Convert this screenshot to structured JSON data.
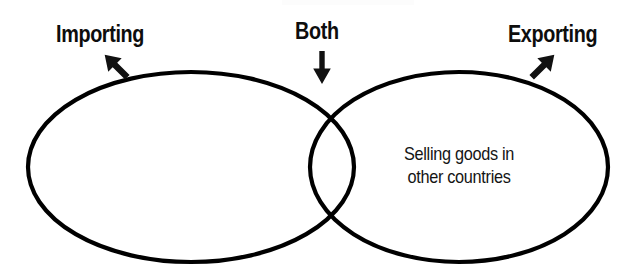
{
  "diagram": {
    "type": "venn",
    "background_color": "#ffffff",
    "stroke_color": "#000000",
    "text_color": "#0d0d0d",
    "width": 630,
    "height": 279,
    "sets": [
      {
        "id": "importing",
        "label": "Importing",
        "cx": 191,
        "cy": 167,
        "rx": 163,
        "ry": 95,
        "region_text": ""
      },
      {
        "id": "exporting",
        "label": "Exporting",
        "cx": 459,
        "cy": 167,
        "rx": 149,
        "ry": 95,
        "region_text_line1": "Selling goods in",
        "region_text_line2": "other countries"
      }
    ],
    "intersection": {
      "label": "Both",
      "top_crossing_x": 322,
      "top_crossing_y": 92,
      "bottom_crossing_x": 322,
      "bottom_crossing_y": 243
    },
    "pointers": [
      {
        "id": "importing-arrow",
        "direction": "down-right",
        "angle_deg": 135
      },
      {
        "id": "both-arrow",
        "direction": "down",
        "angle_deg": 180
      },
      {
        "id": "exporting-arrow",
        "direction": "down-left",
        "angle_deg": 225
      }
    ]
  }
}
